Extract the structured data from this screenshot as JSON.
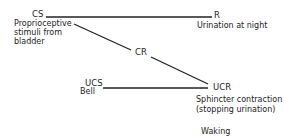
{
  "diagram": {
    "nodes": {
      "cs": {
        "code": "CS",
        "desc": [
          "Proprioceptive",
          "stimuli from",
          "bladder"
        ]
      },
      "r": {
        "code": "R",
        "desc": [
          "Urination at night"
        ]
      },
      "cr": {
        "code": "CR"
      },
      "ucs": {
        "code": "UCS",
        "desc": [
          "Bell"
        ]
      },
      "ucr": {
        "code": "UCR",
        "desc": [
          "Sphincter contraction",
          "(stopping urination)"
        ]
      }
    },
    "caption": "Waking",
    "edges": [
      {
        "from": "CS",
        "to": "R"
      },
      {
        "from": "CS",
        "to": "CR"
      },
      {
        "from": "CR",
        "to": "UCR"
      },
      {
        "from": "UCS",
        "to": "UCR"
      }
    ],
    "line_color": "#222222"
  }
}
